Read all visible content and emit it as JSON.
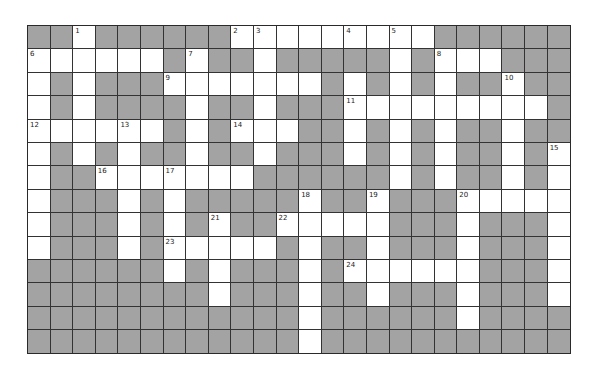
{
  "puzzle": {
    "type": "crossword",
    "columns": 24,
    "rows": 14,
    "colors": {
      "block": "#a3a3a3",
      "open": "#ffffff",
      "grid_line": "#333333"
    },
    "layout": [
      "##.######.........######",
      "......#.##.#####.#...###",
      ".#.###.......#.#.#.##.##",
      ".#.####.##.###.........#",
      "......#.#...##.#.#.##.##",
      ".#.#.##.##.###.#.#.##.#.",
      ".##.......######.#.##.#.",
      ".###.#.#####.##.###.....",
      ".###.#.#.##.....###.###.",
      ".###.#.....#.##.###.###.",
      "######.#.###.#......###.",
      "########.###.##.###.###.",
      "############.######.####",
      "############.###########"
    ],
    "numbers": [
      {
        "n": "1",
        "row": 0,
        "col": 2
      },
      {
        "n": "2",
        "row": 0,
        "col": 9
      },
      {
        "n": "3",
        "row": 0,
        "col": 10
      },
      {
        "n": "4",
        "row": 0,
        "col": 14
      },
      {
        "n": "5",
        "row": 0,
        "col": 16
      },
      {
        "n": "6",
        "row": 1,
        "col": 0
      },
      {
        "n": "7",
        "row": 1,
        "col": 7
      },
      {
        "n": "8",
        "row": 1,
        "col": 18
      },
      {
        "n": "9",
        "row": 2,
        "col": 6
      },
      {
        "n": "10",
        "row": 2,
        "col": 21
      },
      {
        "n": "11",
        "row": 3,
        "col": 14
      },
      {
        "n": "12",
        "row": 4,
        "col": 0
      },
      {
        "n": "13",
        "row": 4,
        "col": 4
      },
      {
        "n": "14",
        "row": 4,
        "col": 9
      },
      {
        "n": "15",
        "row": 5,
        "col": 23
      },
      {
        "n": "16",
        "row": 6,
        "col": 3
      },
      {
        "n": "17",
        "row": 6,
        "col": 6
      },
      {
        "n": "18",
        "row": 7,
        "col": 12
      },
      {
        "n": "19",
        "row": 7,
        "col": 15
      },
      {
        "n": "20",
        "row": 7,
        "col": 19
      },
      {
        "n": "21",
        "row": 8,
        "col": 8
      },
      {
        "n": "22",
        "row": 8,
        "col": 11
      },
      {
        "n": "23",
        "row": 9,
        "col": 6
      },
      {
        "n": "24",
        "row": 10,
        "col": 14
      }
    ]
  }
}
